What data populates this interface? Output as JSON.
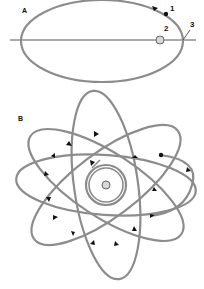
{
  "panel_a": {
    "label": "A",
    "annotations": [
      "1",
      "2",
      "3"
    ],
    "colors": {
      "orbit": "#8c8c8c",
      "star_fill": "#d8d8d8",
      "axis": "#444444"
    }
  },
  "panel_b": {
    "label": "B",
    "colors": {
      "orbit": "#8c8c8c",
      "star_fill": "#d8d8d8"
    }
  }
}
